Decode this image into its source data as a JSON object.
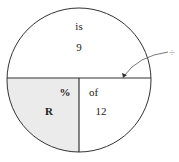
{
  "diagram": {
    "top_section": {
      "label": "is",
      "value": "9"
    },
    "bottom_left_section": {
      "label": "%",
      "value": "R",
      "fill": "#ebebeb"
    },
    "bottom_right_section": {
      "label": "of",
      "value": "12"
    },
    "operator_annotation": "÷",
    "colors": {
      "stroke": "#333333",
      "shaded": "#ebebeb"
    }
  }
}
